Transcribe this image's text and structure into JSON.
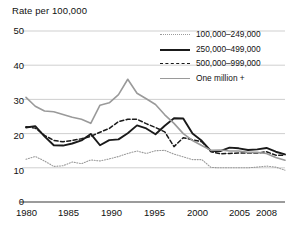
{
  "chart_data": {
    "type": "line",
    "title": "Rate per 100,000",
    "xlabel": "",
    "ylabel": "Rate per 100,000",
    "ylim": [
      0,
      50
    ],
    "xlim": [
      1980,
      2008
    ],
    "yticks": [
      0,
      10,
      20,
      30,
      40,
      50
    ],
    "ytick_labels": [
      "0",
      "10",
      "20",
      "30",
      "40",
      "50"
    ],
    "xticks": [
      1980,
      1985,
      1990,
      1995,
      2000,
      2005,
      2008
    ],
    "xtick_labels": [
      "1980",
      "1985",
      "1990",
      "1995",
      "2000",
      "2005",
      "2008"
    ],
    "grid": true,
    "grid_axis": "y",
    "legend_position": "upper right",
    "x": [
      1980,
      1981,
      1982,
      1983,
      1984,
      1985,
      1986,
      1987,
      1988,
      1989,
      1990,
      1991,
      1992,
      1993,
      1994,
      1995,
      1996,
      1997,
      1998,
      1999,
      2000,
      2001,
      2002,
      2003,
      2004,
      2005,
      2006,
      2007,
      2008
    ],
    "series": [
      {
        "name": "100,000–249,000",
        "style": "dotted",
        "color": "#9a9a9a",
        "values": [
          12.5,
          13.3,
          12.0,
          10.4,
          10.6,
          11.7,
          11.2,
          12.3,
          12.0,
          12.6,
          13.3,
          14.2,
          14.9,
          14.2,
          15.0,
          15.1,
          14.0,
          13.2,
          12.4,
          12.4,
          10.1,
          10.0,
          10.0,
          10.0,
          10.0,
          10.2,
          10.5,
          10.2,
          9.3
        ]
      },
      {
        "name": "250,000–499,000",
        "style": "solid",
        "color": "#1a1a1a",
        "values": [
          21.8,
          22.2,
          19.2,
          16.6,
          16.5,
          17.1,
          18.0,
          19.9,
          16.6,
          18.1,
          18.3,
          20.1,
          22.4,
          21.5,
          19.8,
          22.3,
          24.5,
          24.4,
          20.0,
          17.9,
          14.9,
          14.9,
          15.9,
          15.7,
          15.2,
          15.4,
          15.8,
          14.7,
          13.9
        ]
      },
      {
        "name": "500,000–999,000",
        "style": "dashed",
        "color": "#1a1a1a",
        "values": [
          22.0,
          21.6,
          19.5,
          18.0,
          17.6,
          18.0,
          18.5,
          19.2,
          20.4,
          21.5,
          23.5,
          24.2,
          24.2,
          22.9,
          21.8,
          20.5,
          16.2,
          18.8,
          18.2,
          17.6,
          14.7,
          14.1,
          14.2,
          14.3,
          14.3,
          14.3,
          14.7,
          13.7,
          13.7
        ]
      },
      {
        "name": "One million +",
        "style": "solid",
        "color": "#9a9a9a",
        "values": [
          30.6,
          28.0,
          26.6,
          26.4,
          25.6,
          24.8,
          24.2,
          23.0,
          28.3,
          29.0,
          31.4,
          35.9,
          31.8,
          30.2,
          28.5,
          25.5,
          23.0,
          20.0,
          18.0,
          16.5,
          15.1,
          15.2,
          14.9,
          14.9,
          14.5,
          14.5,
          14.2,
          13.0,
          12.2
        ]
      }
    ]
  },
  "axis": {
    "y_label_50": "50",
    "y_label_40": "40",
    "y_label_30": "30",
    "y_label_20": "20",
    "y_label_10": "10",
    "y_label_0": "0",
    "x_label_1980": "1980",
    "x_label_1985": "1985",
    "x_label_1990": "1990",
    "x_label_1995": "1995",
    "x_label_2000": "2000",
    "x_label_2005": "2005",
    "x_label_2008": "2008"
  },
  "legend": {
    "items": [
      {
        "label": "100,000–249,000"
      },
      {
        "label": "250,000–499,000"
      },
      {
        "label": "500,000–999,000"
      },
      {
        "label": "One million +"
      }
    ]
  },
  "colors": {
    "gray_line": "#9a9a9a",
    "black_line": "#1a1a1a",
    "grid": "#c9c9c9",
    "axis": "#7a7a7a",
    "background": "#ffffff"
  }
}
